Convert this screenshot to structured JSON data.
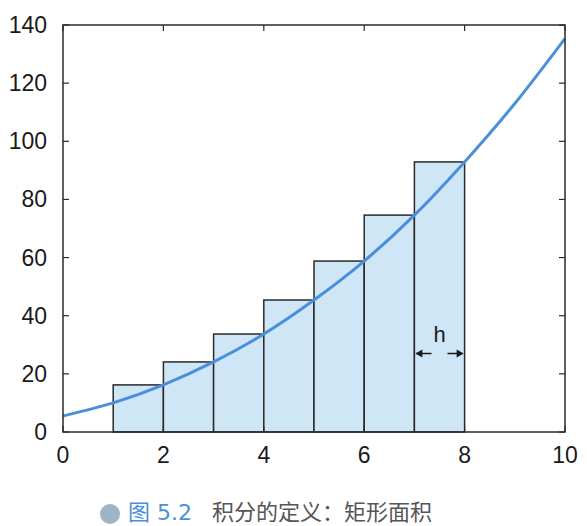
{
  "chart_data": {
    "type": "bar",
    "title": "",
    "xlabel": "",
    "ylabel": "",
    "xlim": [
      0,
      10
    ],
    "ylim": [
      0,
      140
    ],
    "x_ticks": [
      0,
      2,
      4,
      6,
      8,
      10
    ],
    "y_ticks": [
      0,
      20,
      40,
      60,
      80,
      100,
      120,
      140
    ],
    "grid": false,
    "legend": "none",
    "bars": {
      "description": "Right-endpoint rectangles approximating area under curve, width h=1",
      "x_left": [
        1,
        2,
        3,
        4,
        5,
        6,
        7
      ],
      "x_right": [
        2,
        3,
        4,
        5,
        6,
        7,
        8
      ],
      "heights": [
        16.2,
        24.1,
        33.7,
        45.4,
        58.8,
        74.6,
        92.9
      ],
      "fill": "#cfe6f7",
      "stroke": "#2a2a2a"
    },
    "curve": {
      "type": "line",
      "x": [
        0,
        1,
        2,
        3,
        4,
        5,
        6,
        7,
        8,
        9,
        10
      ],
      "y": [
        5.5,
        10.0,
        16.2,
        24.1,
        33.7,
        45.4,
        58.8,
        74.6,
        92.9,
        113.0,
        135.3
      ],
      "color": "#4a90d9"
    },
    "annotations": [
      {
        "text": "h",
        "x_from": 7,
        "x_to": 8,
        "y": 27,
        "kind": "double-arrow width marker"
      }
    ]
  },
  "caption": {
    "figure_number": "图 5.2",
    "text": "积分的定义：矩形面积"
  }
}
